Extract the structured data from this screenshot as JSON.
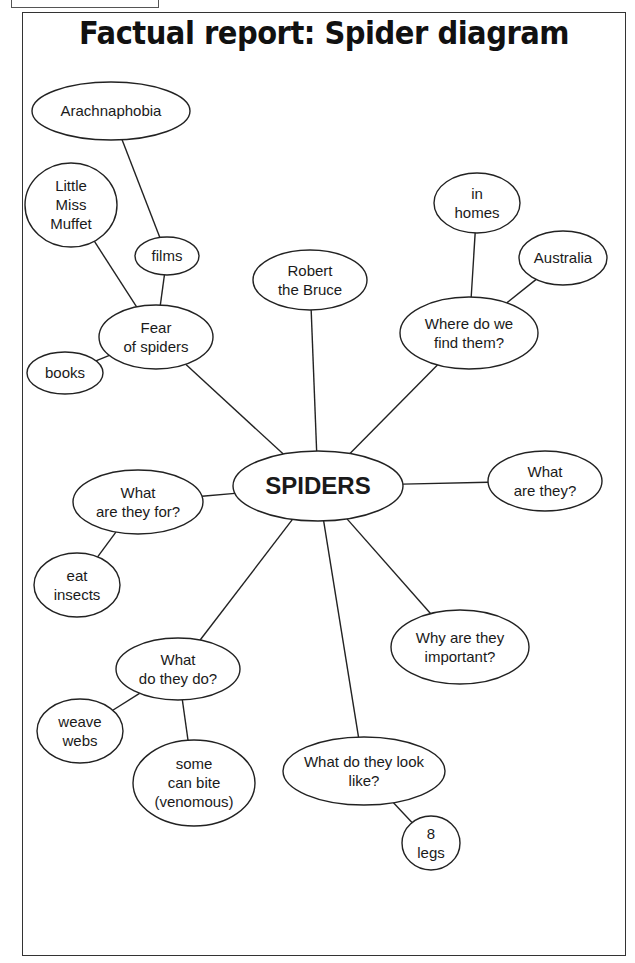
{
  "page": {
    "title": "Factual report: Spider diagram"
  },
  "diagram": {
    "central": {
      "id": "spiders",
      "lines": [
        "SPIDERS"
      ],
      "cx": 318,
      "cy": 486,
      "rx": 85,
      "ry": 35
    },
    "nodes": [
      {
        "id": "fear-of-spiders",
        "lines": [
          "Fear",
          "of spiders"
        ],
        "cx": 156,
        "cy": 337,
        "rx": 57,
        "ry": 32,
        "parent": "spiders"
      },
      {
        "id": "films",
        "lines": [
          "films"
        ],
        "cx": 167,
        "cy": 256,
        "rx": 32,
        "ry": 19,
        "parent": "fear-of-spiders"
      },
      {
        "id": "arachnaphobia",
        "lines": [
          "Arachnaphobia"
        ],
        "cx": 111,
        "cy": 111,
        "rx": 79,
        "ry": 29,
        "parent": "films"
      },
      {
        "id": "little-miss-muffet",
        "lines": [
          "Little",
          "Miss",
          "Muffet"
        ],
        "cx": 71,
        "cy": 205,
        "rx": 46,
        "ry": 42,
        "parent": "fear-of-spiders"
      },
      {
        "id": "books",
        "lines": [
          "books"
        ],
        "cx": 65,
        "cy": 373,
        "rx": 38,
        "ry": 21,
        "parent": "fear-of-spiders"
      },
      {
        "id": "robert-the-bruce",
        "lines": [
          "Robert",
          "the Bruce"
        ],
        "cx": 310,
        "cy": 280,
        "rx": 57,
        "ry": 30,
        "parent": "spiders"
      },
      {
        "id": "where-do-we-find-them",
        "lines": [
          "Where do we",
          "find them?"
        ],
        "cx": 469,
        "cy": 333,
        "rx": 69,
        "ry": 36,
        "parent": "spiders"
      },
      {
        "id": "in-homes",
        "lines": [
          "in",
          "homes"
        ],
        "cx": 477,
        "cy": 203,
        "rx": 43,
        "ry": 30,
        "parent": "where-do-we-find-them"
      },
      {
        "id": "australia",
        "lines": [
          "Australia"
        ],
        "cx": 563,
        "cy": 258,
        "rx": 44,
        "ry": 27,
        "parent": "where-do-we-find-them"
      },
      {
        "id": "what-are-they",
        "lines": [
          "What",
          "are they?"
        ],
        "cx": 545,
        "cy": 481,
        "rx": 57,
        "ry": 30,
        "parent": "spiders"
      },
      {
        "id": "what-are-they-for",
        "lines": [
          "What",
          "are they for?"
        ],
        "cx": 138,
        "cy": 502,
        "rx": 65,
        "ry": 32,
        "parent": "spiders"
      },
      {
        "id": "eat-insects",
        "lines": [
          "eat",
          "insects"
        ],
        "cx": 77,
        "cy": 585,
        "rx": 43,
        "ry": 32,
        "parent": "what-are-they-for"
      },
      {
        "id": "why-are-they-important",
        "lines": [
          "Why are they",
          "important?"
        ],
        "cx": 460,
        "cy": 647,
        "rx": 69,
        "ry": 37,
        "parent": "spiders"
      },
      {
        "id": "what-do-they-do",
        "lines": [
          "What",
          "do they do?"
        ],
        "cx": 178,
        "cy": 669,
        "rx": 62,
        "ry": 31,
        "parent": "spiders"
      },
      {
        "id": "weave-webs",
        "lines": [
          "weave",
          "webs"
        ],
        "cx": 80,
        "cy": 731,
        "rx": 43,
        "ry": 32,
        "parent": "what-do-they-do"
      },
      {
        "id": "some-can-bite",
        "lines": [
          "some",
          "can bite",
          "(venomous)"
        ],
        "cx": 194,
        "cy": 783,
        "rx": 61,
        "ry": 43,
        "parent": "what-do-they-do"
      },
      {
        "id": "what-do-they-look-like",
        "lines": [
          "What do they look",
          "like?"
        ],
        "cx": 364,
        "cy": 771,
        "rx": 81,
        "ry": 34,
        "parent": "spiders"
      },
      {
        "id": "8-legs",
        "lines": [
          "8",
          "legs"
        ],
        "cx": 431,
        "cy": 843,
        "rx": 29,
        "ry": 27,
        "parent": "what-do-they-look-like"
      }
    ],
    "style": {
      "stroke": "#222222",
      "stroke_width": 1.4,
      "node_font_size": 15,
      "central_font_size": 24,
      "line_height": 19
    }
  }
}
